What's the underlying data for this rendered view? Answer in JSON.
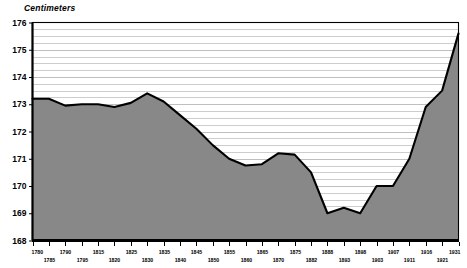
{
  "chart_title": "Centimeters",
  "chart_data": {
    "type": "area",
    "title": "Centimeters",
    "xlabel": "",
    "ylabel": "Centimeters",
    "ylim": [
      168,
      176
    ],
    "xlim": [
      1780,
      1931
    ],
    "grid": true,
    "legend": null,
    "y_major_ticks": [
      168,
      169,
      170,
      171,
      172,
      173,
      174,
      175,
      176
    ],
    "y_minor_step": 0.25,
    "x_tick_labels_upper": [
      "1780",
      "1790",
      "1815",
      "1825",
      "1835",
      "1845",
      "1855",
      "1865",
      "1875",
      "1888",
      "1898",
      "1907",
      "1916",
      "1931"
    ],
    "x_tick_labels_lower": [
      "1785",
      "1795",
      "1820",
      "1830",
      "1840",
      "1850",
      "1860",
      "1870",
      "1882",
      "1893",
      "1903",
      "1911",
      "1921"
    ],
    "x": [
      1780,
      1785,
      1790,
      1795,
      1815,
      1820,
      1825,
      1830,
      1835,
      1840,
      1845,
      1850,
      1855,
      1860,
      1865,
      1870,
      1875,
      1882,
      1888,
      1893,
      1898,
      1903,
      1907,
      1911,
      1916,
      1921,
      1931
    ],
    "values": [
      173.2,
      173.2,
      172.95,
      173.0,
      173.0,
      172.9,
      173.05,
      173.4,
      173.1,
      172.6,
      172.1,
      171.5,
      171.0,
      170.75,
      170.8,
      171.2,
      171.15,
      170.5,
      169.0,
      169.2,
      169.0,
      170.0,
      170.0,
      171.0,
      172.9,
      173.5,
      175.6
    ],
    "series_name": "Height",
    "colors": {
      "area_fill": "#888888",
      "line": "#000000",
      "grid": "#b8b8b8",
      "axis": "#000000",
      "background": "#ffffff"
    }
  }
}
